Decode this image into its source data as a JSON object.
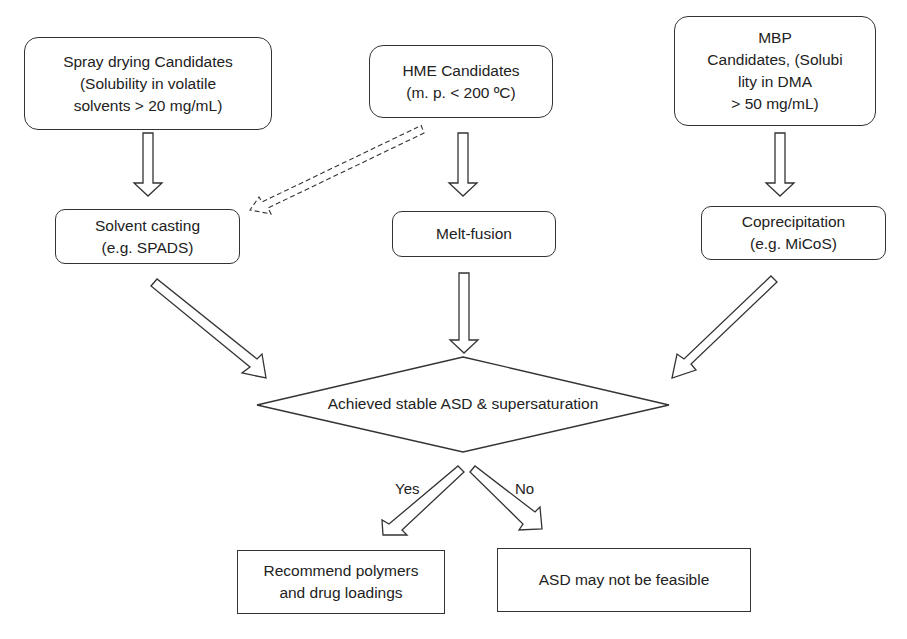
{
  "diagram": {
    "type": "flowchart",
    "nodes": {
      "spray": {
        "id": "spray_drying_candidates",
        "shape": "rounded-rect",
        "lines": [
          "Spray drying Candidates",
          "(Solubility in volatile",
          "solvents > 20 mg/mL)"
        ]
      },
      "hme": {
        "id": "hme_candidates",
        "shape": "rounded-rect",
        "lines": [
          "HME Candidates",
          "(m. p. < 200 ºC)"
        ]
      },
      "mbp": {
        "id": "mbp_candidates",
        "shape": "rounded-rect",
        "lines": [
          "MBP",
          "Candidates, (Solubi",
          "lity in DMA",
          "> 50 mg/mL)"
        ]
      },
      "solvent": {
        "id": "solvent_casting",
        "shape": "rounded-rect",
        "lines": [
          "Solvent casting",
          "(e.g. SPADS)"
        ]
      },
      "melt": {
        "id": "melt_fusion",
        "shape": "rounded-rect",
        "lines": [
          "Melt-fusion"
        ]
      },
      "copre": {
        "id": "coprecipitation",
        "shape": "rounded-rect",
        "lines": [
          "Coprecipitation",
          "(e.g. MiCoS)"
        ]
      },
      "decision": {
        "id": "achieved_stable_asd",
        "shape": "diamond",
        "label": "Achieved stable ASD & supersaturation"
      },
      "recommend": {
        "id": "recommend_polymers",
        "shape": "rect",
        "lines": [
          "Recommend polymers",
          "and drug loadings"
        ]
      },
      "notfeasible": {
        "id": "asd_not_feasible",
        "shape": "rect",
        "lines": [
          "ASD may not be feasible"
        ]
      }
    },
    "edges": [
      {
        "from": "spray_drying_candidates",
        "to": "solvent_casting",
        "style": "hollow"
      },
      {
        "from": "hme_candidates",
        "to": "solvent_casting",
        "style": "hollow-dashed"
      },
      {
        "from": "hme_candidates",
        "to": "melt_fusion",
        "style": "hollow"
      },
      {
        "from": "mbp_candidates",
        "to": "coprecipitation",
        "style": "hollow"
      },
      {
        "from": "solvent_casting",
        "to": "achieved_stable_asd",
        "style": "hollow"
      },
      {
        "from": "melt_fusion",
        "to": "achieved_stable_asd",
        "style": "hollow"
      },
      {
        "from": "coprecipitation",
        "to": "achieved_stable_asd",
        "style": "hollow"
      },
      {
        "from": "achieved_stable_asd",
        "to": "recommend_polymers",
        "style": "hollow",
        "label": "Yes"
      },
      {
        "from": "achieved_stable_asd",
        "to": "asd_not_feasible",
        "style": "hollow",
        "label": "No"
      }
    ],
    "edge_labels": {
      "yes": "Yes",
      "no": "No"
    }
  },
  "colors": {
    "stroke": "#333333",
    "background": "#ffffff",
    "text": "#222222"
  }
}
